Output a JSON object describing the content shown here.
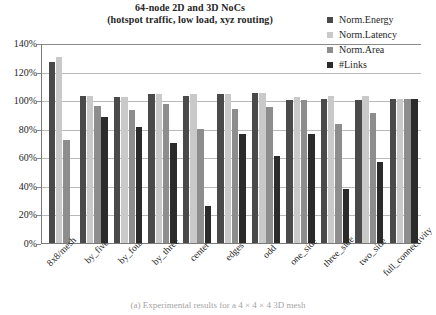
{
  "chart_data": {
    "type": "bar",
    "title": "64-node 2D and 3D NoCs",
    "subtitle": "(hotspot traffic, low load, xyz routing)",
    "title_lines": [
      "64-node 2D and 3D NoCs",
      "(hotspot traffic, low load, xyz routing)"
    ],
    "xlabel": "",
    "ylabel": "",
    "ylim": [
      0,
      140
    ],
    "ytick_step": 20,
    "ytick_labels": [
      "0%",
      "20%",
      "40%",
      "60%",
      "80%",
      "100%",
      "120%",
      "140%"
    ],
    "ytick_values": [
      0,
      20,
      40,
      60,
      80,
      100,
      120,
      140
    ],
    "grid": true,
    "legend_position": "top-right",
    "categories": [
      "8x8/mesh",
      "by_five",
      "by_four",
      "by_three",
      "center",
      "edges",
      "odd",
      "one_side",
      "three_side",
      "two_side",
      "full_connectivity"
    ],
    "series": [
      {
        "name": "Norm.Energy",
        "color": "#4a4a4a",
        "values": [
          127,
          103,
          102,
          104,
          103,
          104,
          105,
          100,
          101,
          100,
          101
        ]
      },
      {
        "name": "Norm.Latency",
        "color": "#c9c9c9",
        "values": [
          130,
          103,
          102,
          104,
          104,
          104,
          105,
          102,
          103,
          103,
          101
        ]
      },
      {
        "name": "Norm.Area",
        "color": "#8d8d8d",
        "values": [
          72,
          96,
          93,
          97,
          80,
          94,
          95,
          100,
          83,
          91,
          101
        ]
      },
      {
        "name": "#Links",
        "color": "#2b2b2b",
        "values": [
          null,
          88,
          81,
          70,
          26,
          76,
          61,
          76,
          38,
          57,
          101
        ]
      }
    ]
  },
  "caption": "(a) Experimental results for a 4 × 4 × 4 3D mesh"
}
